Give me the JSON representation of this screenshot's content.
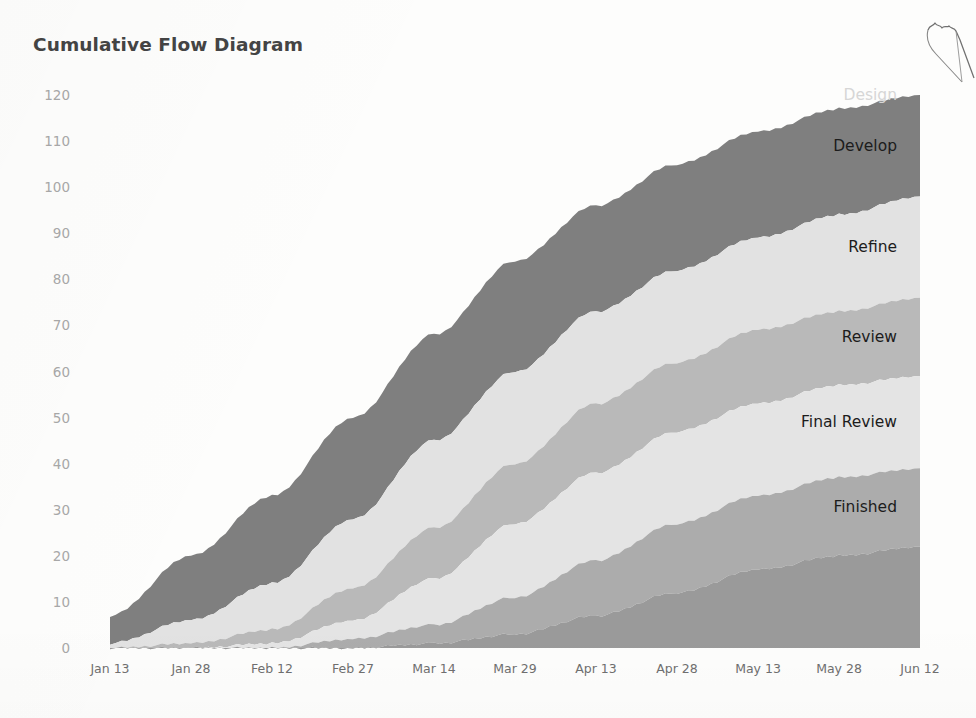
{
  "chart_title": "Cumulative Flow Diagram",
  "axes": {
    "y_ticks": [
      "120",
      "110",
      "100",
      "90",
      "80",
      "70",
      "60",
      "50",
      "40",
      "30",
      "20",
      "10",
      "0"
    ],
    "x_ticks": [
      "Jan 13",
      "Jan 28",
      "Feb 12",
      "Feb 27",
      "Mar 14",
      "Mar 29",
      "Apr 13",
      "Apr 28",
      "May 13",
      "May 28",
      "Jun 12"
    ]
  },
  "band_labels": [
    {
      "text": "Design",
      "color": "#d6d6d6"
    },
    {
      "text": "Develop",
      "color": "#1c1c1c"
    },
    {
      "text": "Refine",
      "color": "#1c1c1c"
    },
    {
      "text": "Review",
      "color": "#1c1c1c"
    },
    {
      "text": "Final Review",
      "color": "#1c1c1c"
    },
    {
      "text": "Finished",
      "color": "#1c1c1c"
    }
  ],
  "chart_data": {
    "type": "area",
    "stacked": true,
    "title": "Cumulative Flow Diagram",
    "xlabel": "",
    "ylabel": "",
    "ylim": [
      0,
      120
    ],
    "grid": false,
    "legend": "inline-band-labels",
    "x": [
      "Jan 13",
      "Jan 28",
      "Feb 12",
      "Feb 27",
      "Mar 14",
      "Mar 29",
      "Apr 13",
      "Apr 28",
      "May 13",
      "May 28",
      "Jun 12"
    ],
    "x_tick_step_days": 15,
    "note": "Values are cumulative top-of-band totals (stacked boundary lines) read off the y-axis at each tick.",
    "cumulative_boundaries": [
      {
        "name": "Design",
        "color": "#7f7f7f",
        "values": [
          7,
          20,
          33,
          50,
          68,
          84,
          96,
          105,
          112,
          117,
          120
        ]
      },
      {
        "name": "Develop",
        "color": "#e2e2e2",
        "values": [
          1,
          6,
          14,
          28,
          45,
          60,
          73,
          82,
          89,
          94,
          98
        ]
      },
      {
        "name": "Refine",
        "color": "#b9b9b9",
        "values": [
          0,
          1,
          4,
          13,
          26,
          40,
          53,
          62,
          69,
          73,
          76
        ]
      },
      {
        "name": "Review",
        "color": "#e4e4e4",
        "values": [
          0,
          0,
          1,
          6,
          15,
          27,
          38,
          47,
          53,
          57,
          59
        ]
      },
      {
        "name": "Final Review",
        "color": "#acacac",
        "values": [
          0,
          0,
          0,
          2,
          5,
          11,
          19,
          27,
          33,
          37,
          39
        ]
      },
      {
        "name": "Finished",
        "color": "#9a9a9a",
        "values": [
          0,
          0,
          0,
          0,
          1,
          3,
          7,
          12,
          17,
          20,
          22
        ]
      }
    ],
    "series": [
      {
        "name": "Design",
        "color": "#7f7f7f",
        "values": [
          6,
          14,
          19,
          22,
          23,
          24,
          23,
          23,
          23,
          23,
          22
        ]
      },
      {
        "name": "Develop",
        "color": "#e2e2e2",
        "values": [
          1,
          5,
          10,
          15,
          19,
          20,
          20,
          20,
          20,
          21,
          22
        ]
      },
      {
        "name": "Refine",
        "color": "#b9b9b9",
        "values": [
          0,
          1,
          3,
          7,
          11,
          13,
          15,
          15,
          16,
          16,
          17
        ]
      },
      {
        "name": "Review",
        "color": "#e4e4e4",
        "values": [
          0,
          0,
          1,
          4,
          10,
          16,
          19,
          20,
          20,
          20,
          20
        ]
      },
      {
        "name": "Final Review",
        "color": "#acacac",
        "values": [
          0,
          0,
          0,
          2,
          4,
          8,
          12,
          15,
          16,
          17,
          17
        ]
      },
      {
        "name": "Finished",
        "color": "#9a9a9a",
        "values": [
          0,
          0,
          0,
          0,
          1,
          3,
          7,
          12,
          17,
          20,
          22
        ]
      }
    ]
  }
}
